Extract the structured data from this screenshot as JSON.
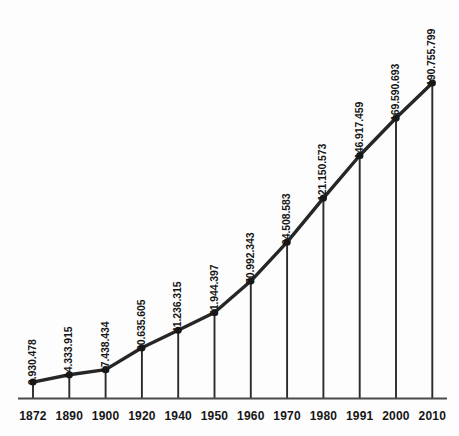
{
  "chart_data": {
    "type": "line",
    "title": "",
    "subtitle": "",
    "xlabel": "",
    "ylabel": "",
    "grid": false,
    "legend": "none",
    "x": [
      "1872",
      "1890",
      "1900",
      "1920",
      "1940",
      "1950",
      "1960",
      "1970",
      "1980",
      "1991",
      "2000",
      "2010"
    ],
    "categories": [
      "1872",
      "1890",
      "1900",
      "1920",
      "1940",
      "1950",
      "1960",
      "1970",
      "1980",
      "1991",
      "2000",
      "2010"
    ],
    "values": [
      9930478,
      14333915,
      17438434,
      30635605,
      41236315,
      51944397,
      70992343,
      94508583,
      121150573,
      146917459,
      169590693,
      190755799
    ],
    "value_labels": [
      "9.930.478",
      "14.333.915",
      "17.438.434",
      "30.635.605",
      "41.236.315",
      "51.944.397",
      "70.992.343",
      "94.508.583",
      "121.150.573",
      "146.917.459",
      "169.590.693",
      "190.755.799"
    ],
    "tick_labels": [
      "1872",
      "1890",
      "1900",
      "1920",
      "1940",
      "1950",
      "1960",
      "1970",
      "1980",
      "1991",
      "2000",
      "2010"
    ],
    "ylim": [
      0,
      190755799
    ],
    "xlim": [
      "1872",
      "2010"
    ],
    "series": [
      {
        "name": "",
        "values": [
          9930478,
          14333915,
          17438434,
          30635605,
          41236315,
          51944397,
          70992343,
          94508583,
          121150573,
          146917459,
          169590693,
          190755799
        ]
      }
    ],
    "marker": "filled-circle",
    "drop_lines": true
  },
  "style": {
    "line_color": "#262626",
    "marker_color": "#1a1a1a",
    "axis_color": "#4a4a4a",
    "drop_line_color": "#2b2b2b",
    "text_color": "#161616",
    "background": "#fdfdfd"
  }
}
